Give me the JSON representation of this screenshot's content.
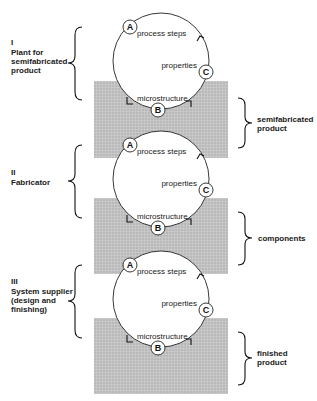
{
  "stages": [
    {
      "numeral": "I",
      "lines": [
        "Plant for",
        "semifabricated",
        "product"
      ]
    },
    {
      "numeral": "II",
      "lines": [
        "Fabricator"
      ]
    },
    {
      "numeral": "III",
      "lines": [
        "System supplier",
        "(design and",
        "finishing)"
      ]
    }
  ],
  "cycle": {
    "markers": {
      "a": "A",
      "b": "B",
      "c": "C"
    },
    "labels": {
      "process": "process steps",
      "properties": "properties",
      "microstructure": "microstructure"
    }
  },
  "outputs": [
    {
      "lines": [
        "semifabricated",
        "product"
      ]
    },
    {
      "lines": [
        "components"
      ]
    },
    {
      "lines": [
        "finished",
        "product"
      ]
    }
  ],
  "colors": {
    "shade": "#b9b9b9",
    "shade_line": "#d2d2d2",
    "ink": "#111111",
    "background": "#ffffff"
  }
}
